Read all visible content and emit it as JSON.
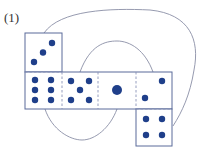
{
  "figure": {
    "label": "(1)",
    "colors": {
      "outline": "#5a6b9a",
      "dashed": "#8a93b8",
      "curve": "#8a8fa6",
      "dot": "#1f3f8a"
    },
    "faces": [
      {
        "id": "top-left",
        "pips": 3
      },
      {
        "id": "row-1",
        "pips": 6
      },
      {
        "id": "row-2",
        "pips": 5
      },
      {
        "id": "row-3",
        "pips": 1
      },
      {
        "id": "row-4",
        "pips": 2
      },
      {
        "id": "bottom-right",
        "pips": 4
      }
    ]
  }
}
